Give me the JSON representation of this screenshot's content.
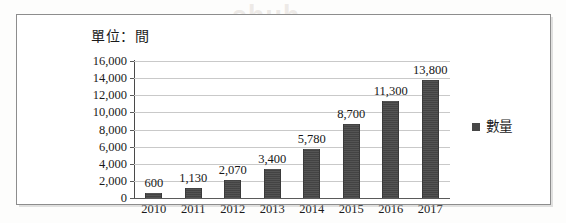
{
  "chart_data": {
    "type": "bar",
    "title": "單位：間",
    "xlabel": "",
    "ylabel": "",
    "categories": [
      "2010",
      "2011",
      "2012",
      "2013",
      "2014",
      "2015",
      "2016",
      "2017"
    ],
    "values": [
      600,
      1130,
      2070,
      3400,
      5780,
      8700,
      11300,
      13800
    ],
    "data_labels": [
      "600",
      "1,130",
      "2,070",
      "3,400",
      "5,780",
      "8,700",
      "11,300",
      "13,800"
    ],
    "series": [
      {
        "name": "數量",
        "values": [
          600,
          1130,
          2070,
          3400,
          5780,
          8700,
          11300,
          13800
        ],
        "color": "#474747"
      }
    ],
    "ylim": [
      0,
      16000
    ],
    "ytick_values": [
      0,
      2000,
      4000,
      6000,
      8000,
      10000,
      12000,
      14000,
      16000
    ],
    "ytick_labels": [
      "0",
      "2,000",
      "4,000",
      "6,000",
      "8,000",
      "10,000",
      "12,000",
      "14,000",
      "16,000"
    ],
    "grid": true,
    "legend_position": "right",
    "legend_entries": [
      "數量"
    ]
  },
  "legend": {
    "label": "數量",
    "swatch_color": "#474747"
  },
  "watermark": {
    "text": "shuh"
  },
  "colors": {
    "bar": "#474747",
    "gridline": "#c9c9c9",
    "axis": "#4a4a4a",
    "frame_border": "#8d8d8d",
    "text": "#1a1a1a"
  }
}
